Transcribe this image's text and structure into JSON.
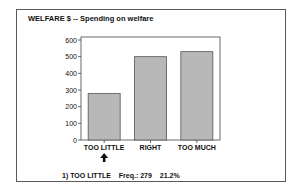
{
  "chart_data": {
    "type": "bar",
    "title": "WELFARE $ -- Spending on welfare",
    "categories": [
      "TOO LITTLE",
      "RIGHT",
      "TOO MUCH"
    ],
    "values": [
      279,
      500,
      530
    ],
    "yticks": [
      0,
      100,
      200,
      300,
      400,
      500,
      600
    ],
    "ylim": [
      0,
      600
    ],
    "xlabel": "",
    "ylabel": "",
    "grid": false,
    "bar_color": "#b8b8b8",
    "selected_index": 0
  },
  "footer": {
    "selection": "1) TOO LITTLE",
    "freq": "Freq.: 279",
    "percent": "21.2%"
  }
}
